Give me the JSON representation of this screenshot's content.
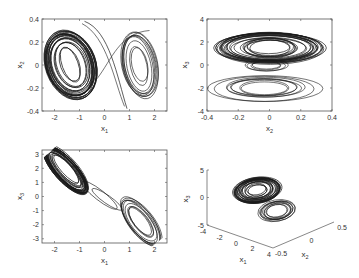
{
  "figure": {
    "background": "#ffffff",
    "line_color": "#1a1a1a",
    "axis_color": "#555555"
  },
  "chart_data": [
    {
      "id": "top-left",
      "type": "line",
      "title": "",
      "xlabel": "x",
      "xlabel_sub": "1",
      "ylabel": "x",
      "ylabel_sub": "2",
      "xlim": [
        -2.5,
        2.5
      ],
      "ylim": [
        -0.4,
        0.4
      ],
      "xticks": [
        -2,
        -1,
        0,
        1,
        2
      ],
      "xtick_labels": [
        "-2",
        "-1",
        "0",
        "1",
        "2"
      ],
      "yticks": [
        -0.4,
        -0.2,
        0,
        0.2,
        0.4
      ],
      "ytick_labels": [
        "-0.4",
        "-0.2",
        "0",
        "0.2",
        "0.4"
      ],
      "grid": false,
      "description": "Double-scroll attractor projection: dense loops centered near (-1.4, 0) and sparser loops near (1.4, 0)",
      "lobes": [
        {
          "cx": -1.4,
          "cy": 0.0,
          "rx_range": [
            0.25,
            0.8
          ],
          "ry_range": [
            0.08,
            0.34
          ],
          "density": "high"
        },
        {
          "cx": 1.4,
          "cy": 0.0,
          "rx_range": [
            0.3,
            0.75
          ],
          "ry_range": [
            0.1,
            0.33
          ],
          "density": "low"
        }
      ]
    },
    {
      "id": "top-right",
      "type": "line",
      "title": "",
      "xlabel": "x",
      "xlabel_sub": "2",
      "ylabel": "x",
      "ylabel_sub": "3",
      "xlim": [
        -0.4,
        0.4
      ],
      "ylim": [
        -4,
        4
      ],
      "xticks": [
        -0.4,
        -0.2,
        0,
        0.2,
        0.4
      ],
      "xtick_labels": [
        "-0.4",
        "-0.2",
        "0",
        "0.2",
        "0.4"
      ],
      "yticks": [
        -4,
        -2,
        0,
        2,
        4
      ],
      "ytick_labels": [
        "-4",
        "-2",
        "0",
        "2",
        "4"
      ],
      "grid": false,
      "description": "Two stacked elliptical bands: dense band centered near x3=1.5, lighter band centered near x3=-2",
      "lobes": [
        {
          "cx": 0.0,
          "cy": 1.5,
          "rx_range": [
            0.1,
            0.35
          ],
          "ry_range": [
            0.4,
            1.6
          ],
          "density": "high"
        },
        {
          "cx": -0.02,
          "cy": -2.0,
          "rx_range": [
            0.1,
            0.36
          ],
          "ry_range": [
            0.4,
            1.3
          ],
          "density": "low"
        }
      ]
    },
    {
      "id": "bottom-left",
      "type": "line",
      "title": "",
      "xlabel": "x",
      "xlabel_sub": "1",
      "ylabel": "x",
      "ylabel_sub": "3",
      "xlim": [
        -2.5,
        2.5
      ],
      "ylim": [
        -3.3,
        3.3
      ],
      "xticks": [
        -2,
        -1,
        0,
        1,
        2
      ],
      "xtick_labels": [
        "-2",
        "-1",
        "0",
        "1",
        "2"
      ],
      "yticks": [
        -3,
        -2,
        -1,
        0,
        1,
        2,
        3
      ],
      "ytick_labels": [
        "-3",
        "-2",
        "-1",
        "0",
        "1",
        "2",
        "3"
      ],
      "grid": false,
      "description": "Two tilted elongated lobes along anti-diagonal: dense near (-1.5, 1.8), lighter near (1.5, -1.8)",
      "lobes": [
        {
          "cx": -1.5,
          "cy": 1.8,
          "angle_deg": -55,
          "density": "high"
        },
        {
          "cx": 1.5,
          "cy": -1.8,
          "angle_deg": -55,
          "density": "low"
        }
      ]
    },
    {
      "id": "bottom-right",
      "type": "line3d",
      "title": "",
      "xlabel": "x",
      "xlabel_sub": "1",
      "ylabel": "x",
      "ylabel_sub": "2",
      "zlabel": "x",
      "zlabel_sub": "3",
      "xlim": [
        -4,
        4
      ],
      "ylim": [
        -0.5,
        0.5
      ],
      "zlim": [
        -5,
        5
      ],
      "xticks": [
        -4,
        -2,
        0,
        2,
        4
      ],
      "xtick_labels": [
        "-4",
        "-2",
        "0",
        "2",
        "4"
      ],
      "yticks": [
        -0.5,
        0,
        0.5
      ],
      "ytick_labels": [
        "-0.5",
        "0",
        "0.5"
      ],
      "zticks": [
        -5,
        0,
        5
      ],
      "ztick_labels": [
        "-5",
        "0",
        "5"
      ],
      "grid": false,
      "description": "3D view of the double-scroll attractor: two stacked scroll disks"
    }
  ]
}
